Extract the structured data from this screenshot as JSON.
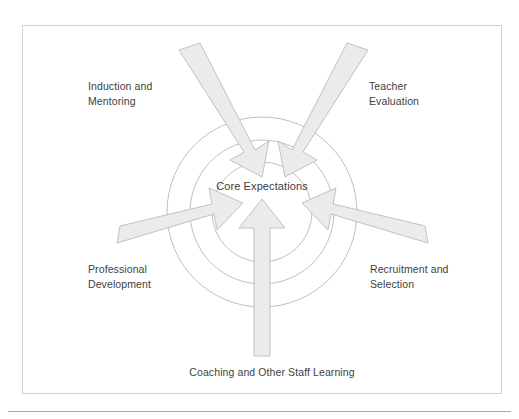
{
  "figure": {
    "center_label": "Core Expectations",
    "nodes": [
      {
        "id": "induction-and-mentoring",
        "label": "Induction and\nMentoring",
        "position": "top-left"
      },
      {
        "id": "teacher-evaluation",
        "label": "Teacher\nEvaluation",
        "position": "top-right"
      },
      {
        "id": "professional-development",
        "label": "Professional\nDevelopment",
        "position": "left"
      },
      {
        "id": "recruitment-and-selection",
        "label": "Recruitment and\nSelection",
        "position": "right"
      },
      {
        "id": "coaching-and-other-staff-learning",
        "label": "Coaching and Other Staff Learning",
        "position": "bottom"
      }
    ],
    "colors": {
      "arrow_fill": "#ebebeb",
      "arrow_stroke": "#b4b4b4",
      "circle_stroke": "#b9b9b9",
      "frame_border": "#d2d2d2",
      "text": "#414141",
      "background": "#ffffff"
    },
    "rings": {
      "count": 3,
      "center": [
        262,
        212
      ],
      "radii": [
        50,
        72,
        95
      ]
    },
    "arrow_count": 5
  }
}
